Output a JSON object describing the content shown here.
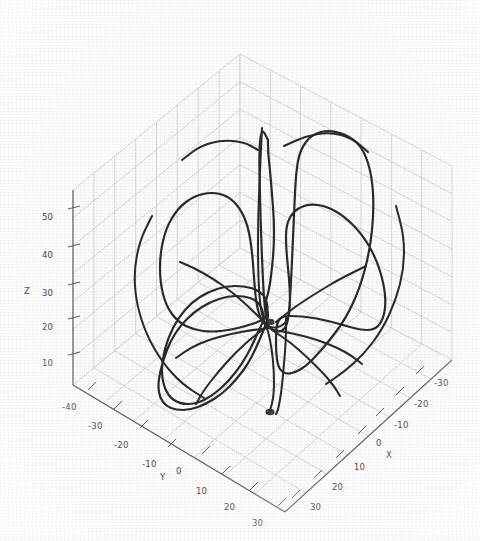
{
  "figure": {
    "kind": "matplotlib-3d-line-plot",
    "background_color": "#ffffff",
    "grid_color": "#c8c8c8",
    "axis_color": "#555555",
    "curve_color": "#2b2b2b",
    "tick_text_color": "#3a3a3a",
    "scan_artifact": "photocopy grain"
  },
  "axes": {
    "x": {
      "label": "X",
      "ticks": [
        -30,
        -20,
        -10,
        0,
        10,
        20,
        30
      ],
      "tick_labels": [
        "-30",
        "-20",
        "-10",
        "0",
        "10",
        "20",
        "30"
      ],
      "range": [
        -35,
        35
      ],
      "label_position": "bottom-right"
    },
    "y": {
      "label": "Y",
      "ticks": [
        -40,
        -30,
        -20,
        -10,
        0,
        10,
        20,
        30
      ],
      "tick_labels": [
        "-40",
        "-30",
        "-20",
        "-10",
        "0",
        "10",
        "20",
        "30"
      ],
      "range": [
        -45,
        35
      ],
      "label_position": "bottom-left"
    },
    "z": {
      "label": "Z",
      "ticks": [
        10,
        20,
        30,
        40,
        50
      ],
      "tick_labels": [
        "10",
        "20",
        "30",
        "40",
        "50"
      ],
      "range": [
        0,
        55
      ],
      "label_position": "left"
    }
  },
  "chart_data": {
    "type": "line",
    "title": "",
    "xlabel": "X",
    "ylabel": "Y",
    "zlabel": "Z",
    "projection": "3d",
    "grid": true,
    "legend": null,
    "xlim": [
      -35,
      35
    ],
    "ylim": [
      -45,
      35
    ],
    "zlim": [
      0,
      55
    ],
    "xticks": [
      -30,
      -20,
      -10,
      0,
      10,
      20,
      30
    ],
    "yticks": [
      -40,
      -30,
      -20,
      -10,
      0,
      10,
      20,
      30
    ],
    "zticks": [
      10,
      20,
      30,
      40,
      50
    ],
    "series": [
      {
        "name": "trajectory",
        "color": "#2b2b2b",
        "linewidth": 2.2,
        "description": "Closed butterfly-shaped orbit with two symmetric lobes and a vertical central spike; strands converge at an upper node and a lower node near the vertical axis.",
        "points_screen": [
          [
            268,
            140
          ],
          [
            262,
            128
          ],
          [
            259,
            148
          ],
          [
            260,
            200
          ],
          [
            262,
            260
          ],
          [
            264,
            300
          ],
          [
            266,
            318
          ],
          [
            268,
            326
          ],
          [
            272,
            330
          ],
          [
            278,
            332
          ],
          [
            284,
            330
          ],
          [
            288,
            322
          ],
          [
            290,
            300
          ],
          [
            292,
            262
          ],
          [
            294,
            214
          ],
          [
            296,
            172
          ],
          [
            300,
            150
          ],
          [
            312,
            134
          ],
          [
            330,
            130
          ],
          [
            350,
            136
          ],
          [
            364,
            150
          ],
          [
            372,
            176
          ],
          [
            374,
            210
          ],
          [
            370,
            250
          ],
          [
            360,
            288
          ],
          [
            346,
            318
          ],
          [
            330,
            340
          ],
          [
            316,
            356
          ],
          [
            306,
            366
          ],
          [
            296,
            372
          ],
          [
            288,
            374
          ],
          [
            282,
            372
          ],
          [
            278,
            366
          ],
          [
            276,
            352
          ],
          [
            276,
            330
          ],
          [
            278,
            320
          ],
          [
            284,
            316
          ],
          [
            296,
            316
          ],
          [
            316,
            318
          ],
          [
            340,
            324
          ],
          [
            360,
            330
          ],
          [
            374,
            330
          ],
          [
            382,
            322
          ],
          [
            386,
            306
          ],
          [
            384,
            284
          ],
          [
            376,
            258
          ],
          [
            362,
            234
          ],
          [
            344,
            216
          ],
          [
            326,
            206
          ],
          [
            310,
            204
          ],
          [
            298,
            208
          ],
          [
            290,
            216
          ],
          [
            286,
            228
          ],
          [
            286,
            246
          ],
          [
            288,
            268
          ],
          [
            290,
            290
          ],
          [
            290,
            308
          ],
          [
            288,
            320
          ],
          [
            282,
            326
          ],
          [
            274,
            328
          ],
          [
            266,
            326
          ],
          [
            260,
            318
          ],
          [
            256,
            302
          ],
          [
            254,
            278
          ],
          [
            252,
            250
          ],
          [
            248,
            226
          ],
          [
            240,
            208
          ],
          [
            228,
            196
          ],
          [
            212,
            192
          ],
          [
            194,
            196
          ],
          [
            178,
            208
          ],
          [
            166,
            228
          ],
          [
            160,
            254
          ],
          [
            160,
            282
          ],
          [
            166,
            306
          ],
          [
            178,
            322
          ],
          [
            194,
            330
          ],
          [
            212,
            332
          ],
          [
            230,
            330
          ],
          [
            246,
            326
          ],
          [
            258,
            322
          ],
          [
            266,
            318
          ],
          [
            268,
            310
          ],
          [
            266,
            298
          ],
          [
            258,
            290
          ],
          [
            244,
            286
          ],
          [
            226,
            286
          ],
          [
            208,
            292
          ],
          [
            192,
            302
          ],
          [
            178,
            318
          ],
          [
            168,
            338
          ],
          [
            162,
            360
          ],
          [
            162,
            380
          ],
          [
            168,
            396
          ],
          [
            180,
            404
          ],
          [
            196,
            404
          ],
          [
            212,
            396
          ],
          [
            228,
            382
          ],
          [
            242,
            364
          ],
          [
            252,
            346
          ],
          [
            258,
            332
          ],
          [
            262,
            324
          ],
          [
            264,
            318
          ],
          [
            262,
            308
          ],
          [
            256,
            300
          ],
          [
            244,
            296
          ],
          [
            228,
            296
          ],
          [
            210,
            302
          ],
          [
            194,
            312
          ],
          [
            180,
            326
          ],
          [
            170,
            342
          ],
          [
            164,
            358
          ],
          [
            160,
            372
          ],
          [
            158,
            386
          ],
          [
            160,
            398
          ],
          [
            166,
            406
          ],
          [
            176,
            410
          ],
          [
            190,
            410
          ],
          [
            206,
            404
          ],
          [
            222,
            394
          ],
          [
            236,
            380
          ],
          [
            248,
            364
          ],
          [
            256,
            348
          ],
          [
            262,
            334
          ],
          [
            266,
            324
          ],
          [
            268,
            318
          ],
          [
            268,
            312
          ],
          [
            266,
            306
          ],
          [
            266,
            300
          ],
          [
            268,
            294
          ],
          [
            270,
            284
          ],
          [
            272,
            268
          ],
          [
            274,
            246
          ],
          [
            274,
            220
          ],
          [
            272,
            194
          ],
          [
            270,
            170
          ],
          [
            268,
            152
          ],
          [
            268,
            140
          ]
        ],
        "aux_strands": [
          [
            [
              262,
              128
            ],
            [
              260,
              170
            ],
            [
              258,
              220
            ],
            [
              258,
              270
            ],
            [
              260,
              306
            ],
            [
              264,
              322
            ],
            [
              268,
              330
            ],
            [
              272,
              350
            ],
            [
              274,
              372
            ],
            [
              274,
              392
            ],
            [
              272,
              404
            ],
            [
              270,
              410
            ]
          ],
          [
            [
              286,
              318
            ],
            [
              286,
              340
            ],
            [
              284,
              364
            ],
            [
              282,
              386
            ],
            [
              280,
              400
            ],
            [
              278,
              410
            ],
            [
              276,
              414
            ]
          ],
          [
            [
              268,
              326
            ],
            [
              254,
              336
            ],
            [
              236,
              352
            ],
            [
              218,
              372
            ],
            [
              204,
              390
            ],
            [
              196,
              404
            ]
          ],
          [
            [
              272,
              330
            ],
            [
              290,
              342
            ],
            [
              308,
              358
            ],
            [
              324,
              374
            ],
            [
              334,
              386
            ],
            [
              340,
              396
            ]
          ],
          [
            [
              270,
              328
            ],
            [
              252,
              330
            ],
            [
              230,
              334
            ],
            [
              208,
              340
            ],
            [
              190,
              348
            ],
            [
              176,
              358
            ]
          ],
          [
            [
              274,
              330
            ],
            [
              296,
              334
            ],
            [
              318,
              340
            ],
            [
              338,
              348
            ],
            [
              352,
              356
            ],
            [
              362,
              364
            ]
          ],
          [
            [
              264,
              322
            ],
            [
              250,
              308
            ],
            [
              232,
              292
            ],
            [
              212,
              278
            ],
            [
              194,
              268
            ],
            [
              180,
              262
            ]
          ],
          [
            [
              276,
              322
            ],
            [
              296,
              306
            ],
            [
              318,
              292
            ],
            [
              338,
              280
            ],
            [
              354,
              272
            ],
            [
              366,
              266
            ]
          ],
          [
            [
              152,
              216
            ],
            [
              140,
              240
            ],
            [
              134,
              270
            ],
            [
              136,
              302
            ],
            [
              146,
              334
            ],
            [
              162,
              362
            ],
            [
              182,
              384
            ],
            [
              204,
              398
            ]
          ],
          [
            [
              396,
              206
            ],
            [
              404,
              236
            ],
            [
              404,
              268
            ],
            [
              396,
              300
            ],
            [
              382,
              330
            ],
            [
              364,
              354
            ],
            [
              344,
              372
            ],
            [
              326,
              384
            ]
          ],
          [
            [
              182,
              160
            ],
            [
              200,
              146
            ],
            [
              222,
              140
            ],
            [
              244,
              142
            ],
            [
              258,
              150
            ]
          ],
          [
            [
              284,
              146
            ],
            [
              306,
              136
            ],
            [
              330,
              132
            ],
            [
              352,
              138
            ],
            [
              368,
              152
            ]
          ]
        ]
      }
    ],
    "annotations": [
      {
        "text": "upper convergence node",
        "screen": [
          270,
          322
        ]
      },
      {
        "text": "lower convergence node",
        "screen": [
          270,
          412
        ]
      }
    ]
  },
  "geometry": {
    "note": "screen coordinates of the 3d box corners used to draw panes and axes",
    "box": {
      "origin_bottom": [
        285,
        512
      ],
      "left_bottom": [
        73,
        385
      ],
      "right_bottom": [
        452,
        360
      ],
      "back_bottom": [
        240,
        248
      ],
      "origin_top": [
        285,
        318
      ],
      "left_top": [
        73,
        190
      ],
      "right_top": [
        452,
        166
      ],
      "back_top": [
        240,
        54
      ]
    }
  },
  "tick_marks": {
    "z": [
      {
        "label": "50",
        "x": 42,
        "y": 212
      },
      {
        "label": "40",
        "x": 42,
        "y": 250
      },
      {
        "label": "30",
        "x": 42,
        "y": 288
      },
      {
        "label": "20",
        "x": 42,
        "y": 322
      },
      {
        "label": "10",
        "x": 42,
        "y": 358
      }
    ],
    "z_axis_label": {
      "label": "Z",
      "x": 24,
      "y": 286
    },
    "y": [
      {
        "label": "-40",
        "x": 62,
        "y": 402
      },
      {
        "label": "-30",
        "x": 88,
        "y": 421
      },
      {
        "label": "-20",
        "x": 114,
        "y": 440
      },
      {
        "label": "-10",
        "x": 142,
        "y": 459
      },
      {
        "label": "0",
        "x": 176,
        "y": 466
      },
      {
        "label": "10",
        "x": 196,
        "y": 486
      },
      {
        "label": "20",
        "x": 224,
        "y": 502
      },
      {
        "label": "30",
        "x": 252,
        "y": 518
      }
    ],
    "y_axis_label": {
      "label": "Y",
      "x": 160,
      "y": 472
    },
    "x": [
      {
        "label": "-30",
        "x": 434,
        "y": 378
      },
      {
        "label": "-20",
        "x": 414,
        "y": 399
      },
      {
        "label": "-10",
        "x": 394,
        "y": 420
      },
      {
        "label": "0",
        "x": 376,
        "y": 438
      },
      {
        "label": "10",
        "x": 354,
        "y": 462
      },
      {
        "label": "20",
        "x": 332,
        "y": 482
      },
      {
        "label": "30",
        "x": 310,
        "y": 502
      }
    ],
    "x_axis_label": {
      "label": "X",
      "x": 386,
      "y": 450
    }
  }
}
